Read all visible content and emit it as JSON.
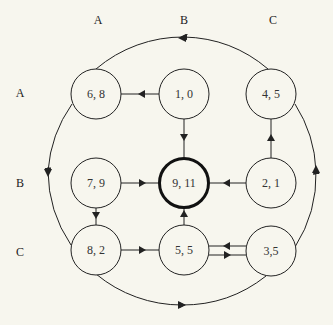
{
  "column_labels": [
    "A",
    "B",
    "C"
  ],
  "row_labels": [
    "A",
    "B",
    "C"
  ],
  "nodes": [
    {
      "id": "AA",
      "label": "6, 8",
      "row": "A",
      "col": "A",
      "highlight": false
    },
    {
      "id": "AB",
      "label": "1, 0",
      "row": "A",
      "col": "B",
      "highlight": false
    },
    {
      "id": "AC",
      "label": "4, 5",
      "row": "A",
      "col": "C",
      "highlight": false
    },
    {
      "id": "BA",
      "label": "7, 9",
      "row": "B",
      "col": "A",
      "highlight": false
    },
    {
      "id": "BB",
      "label": "9, 11",
      "row": "B",
      "col": "B",
      "highlight": true
    },
    {
      "id": "BC",
      "label": "2, 1",
      "row": "B",
      "col": "C",
      "highlight": false
    },
    {
      "id": "CA",
      "label": "8, 2",
      "row": "C",
      "col": "A",
      "highlight": false
    },
    {
      "id": "CB",
      "label": "5, 5",
      "row": "C",
      "col": "B",
      "highlight": false
    },
    {
      "id": "CC",
      "label": "3,5",
      "row": "C",
      "col": "C",
      "highlight": false
    }
  ],
  "edges": [
    {
      "from": "AB",
      "to": "AA"
    },
    {
      "from": "AB",
      "to": "BB"
    },
    {
      "from": "BC",
      "to": "AC"
    },
    {
      "from": "BA",
      "to": "BB"
    },
    {
      "from": "BC",
      "to": "BB"
    },
    {
      "from": "BA",
      "to": "CA"
    },
    {
      "from": "CB",
      "to": "BB"
    },
    {
      "from": "CA",
      "to": "CB"
    },
    {
      "from": "CC",
      "to": "CB"
    },
    {
      "from": "CB",
      "to": "CC"
    },
    {
      "from": "AC",
      "to": "AA",
      "type": "outer-arc"
    },
    {
      "from": "AA",
      "to": "CA",
      "type": "outer-arc"
    },
    {
      "from": "CA",
      "to": "CC",
      "type": "outer-arc"
    },
    {
      "from": "CC",
      "to": "AC",
      "type": "outer-arc"
    }
  ],
  "colors": {
    "background": "#f7f6ee",
    "stroke": "#222222",
    "text": "#333333"
  }
}
